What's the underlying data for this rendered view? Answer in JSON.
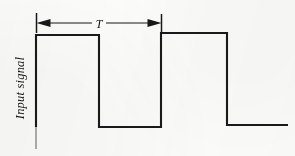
{
  "figure": {
    "background_color": "#fdfdfc",
    "ink_color": "#1a1a1a",
    "axis_label": "Input signal",
    "period_label": "T"
  },
  "chart_data": {
    "type": "line",
    "title": "Input signal",
    "xlabel": "",
    "ylabel": "Input signal",
    "grid": false,
    "legend_position": "none",
    "annotations": [
      {
        "name": "period-dimension",
        "label": "T",
        "description": "Double-headed arrow spanning one full period of the square wave",
        "x_start": 36,
        "x_end": 162,
        "y": 23
      }
    ],
    "axis_ranges": {
      "x": [
        36,
        288
      ],
      "y": [
        127,
        33
      ]
    },
    "levels": {
      "high": "high",
      "low": "low"
    },
    "series": [
      {
        "name": "Input signal",
        "color": "#1a1a1a",
        "points": [
          [
            36,
            127
          ],
          [
            36,
            35
          ],
          [
            99,
            35
          ],
          [
            99,
            127
          ],
          [
            161,
            127
          ],
          [
            161,
            33
          ],
          [
            227,
            33
          ],
          [
            227,
            125
          ],
          [
            288,
            125
          ]
        ]
      }
    ]
  },
  "geometry": {
    "wave_path": "M 36,127 L 36,35 L 99,35 L 99,127 L 161,127 L 161,33 L 227,33 L 227,125 L 288,125",
    "dimension_line": {
      "x1": 40,
      "y1": 23,
      "x2": 158,
      "y2": 23
    },
    "left_tick": {
      "x1": 36.5,
      "y1": 13,
      "x2": 36.5,
      "y2": 33
    },
    "right_tick": {
      "x1": 161.5,
      "y1": 14,
      "x2": 161.5,
      "y2": 33
    },
    "left_arrowhead": "M 36.5,23 L 50,19.2 L 50,26.8 Z",
    "right_arrowhead": "M 161.5,23 L 148,19.2 L 148,26.8 Z",
    "y_axis_line": {
      "x1": 36,
      "y1": 127,
      "x2": 36,
      "y2": 149
    },
    "axis_label_transform": "translate(24,88) rotate(-90)",
    "period_label_position": {
      "x": 99,
      "y": 27
    }
  }
}
